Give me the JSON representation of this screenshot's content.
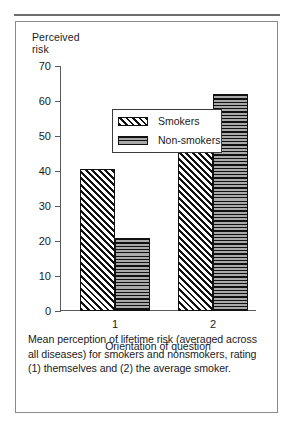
{
  "figure": {
    "caption": "Mean perception of lifetime risk (averaged across all diseases) for smokers and nonsmokers, rating (1) themselves and (2) the average smoker."
  },
  "chart_data": {
    "type": "bar",
    "title": "",
    "ylabel": "Perceived\nrisk",
    "ylabel_line1": "Perceived",
    "ylabel_line2": "risk",
    "xlabel": "Orientation of question",
    "categories": [
      "1",
      "2"
    ],
    "yticks": [
      0,
      10,
      20,
      30,
      40,
      50,
      60,
      70
    ],
    "ytick_labels": [
      "0",
      "10",
      "20",
      "30",
      "40",
      "50",
      "60",
      "70"
    ],
    "ylim": [
      0,
      70
    ],
    "grid": false,
    "legend_position": "upper left inside plot",
    "series": [
      {
        "name": "Smokers",
        "pattern": "diagonal-hatch",
        "color": "#ffffff",
        "line_color": "#111111",
        "values": [
          40.5,
          50.5
        ]
      },
      {
        "name": "Non-smokers",
        "pattern": "horizontal-lines",
        "color": "#8e8e8e",
        "line_color": "#111111",
        "values": [
          21,
          62
        ]
      }
    ]
  }
}
